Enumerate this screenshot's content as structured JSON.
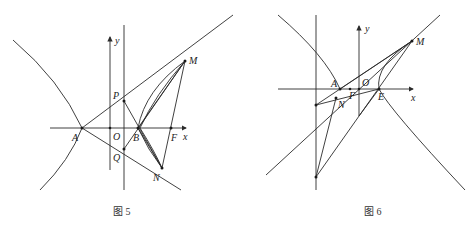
{
  "figures": [
    {
      "id": "fig5",
      "caption": "图 5",
      "labels": {
        "y": "y",
        "x": "x",
        "A": "A",
        "O": "O",
        "B": "B",
        "F": "F",
        "P": "P",
        "Q": "Q",
        "M": "M",
        "N": "N"
      }
    },
    {
      "id": "fig6",
      "caption": "图 6",
      "labels": {
        "y": "y",
        "x": "x",
        "A": "A",
        "O": "O",
        "F": "F",
        "E": "E",
        "M": "M",
        "N": "N"
      }
    }
  ],
  "colors": {
    "line": "#2b2b2b",
    "background": "#ffffff"
  }
}
